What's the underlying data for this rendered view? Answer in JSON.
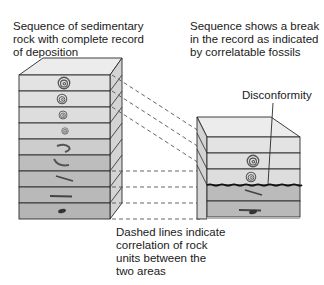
{
  "labels": {
    "left_caption": [
      "Sequence of sedimentary",
      "rock with complete record",
      "of deposition"
    ],
    "right_caption": [
      "Sequence shows a break",
      "in the record as indicated",
      "by correlatable fossils"
    ],
    "disconformity": "Disconformity",
    "bottom_caption": [
      "Dashed lines indicate",
      "correlation of rock",
      "units between the",
      "two areas"
    ]
  },
  "left_column": {
    "layers": [
      {
        "fossil": "large-ammonite-icon",
        "shade": "#e2e2e2"
      },
      {
        "fossil": "medium-ammonite-icon",
        "shade": "#e0e0e0"
      },
      {
        "fossil": "small-ammonite-icon",
        "shade": "#dddddd"
      },
      {
        "fossil": "tiny-ammonite-icon",
        "shade": "#d9d9d9"
      },
      {
        "fossil": "hook-shell-icon",
        "shade": "#cfcfcf"
      },
      {
        "fossil": "curved-shell-icon",
        "shade": "#bdbdbd"
      },
      {
        "fossil": "slim-shell-icon",
        "shade": "#bbbbbb"
      },
      {
        "fossil": "flat-shell-icon",
        "shade": "#b9b9b9"
      },
      {
        "fossil": "small-fossil-icon",
        "shade": "#b6b6b6"
      }
    ]
  },
  "right_column": {
    "layers": [
      {
        "fossil": "none",
        "shade": "#e2e2e2"
      },
      {
        "fossil": "large-ammonite-icon",
        "shade": "#e0e0e0"
      },
      {
        "fossil": "medium-ammonite-icon",
        "shade": "#dddddd"
      },
      {
        "fossil": "slim-shell-icon",
        "shade": "#bbbbbb"
      },
      {
        "fossil": "flat-shell-icon",
        "shade": "#b9b9b9"
      },
      {
        "fossil": "small-fossil-icon",
        "shade": "#b6b6b6"
      }
    ],
    "gap": "disconformity between medium-ammonite and slim-shell layers"
  },
  "colors": {
    "outline": "#2a2a2a",
    "top_face": "#ececec",
    "side_face": "#d6d6d6",
    "dash": "#555555"
  }
}
